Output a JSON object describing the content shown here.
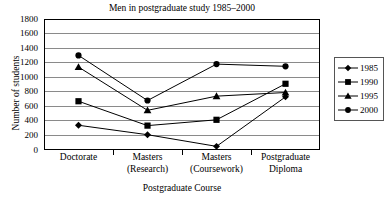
{
  "chart_data": {
    "type": "line",
    "title": "Men in postgraduate study 1985–2000",
    "xlabel": "Postgraduate Course",
    "ylabel": "Number of students",
    "categories": [
      "Doctorate",
      "Masters (Research)",
      "Masters (Coursework)",
      "Postgraduate Diploma"
    ],
    "category_lines": [
      [
        "Doctorate"
      ],
      [
        "Masters",
        "(Research)"
      ],
      [
        "Masters",
        "(Coursework)"
      ],
      [
        "Postgraduate",
        "Diploma"
      ]
    ],
    "ylim": [
      0,
      1800
    ],
    "ytick_step": 200,
    "yticks": [
      1800,
      1600,
      1400,
      1200,
      1000,
      800,
      600,
      400,
      200,
      0
    ],
    "ytick_labels": [
      "1800",
      "1600",
      "1400",
      "1200",
      "1000",
      "800",
      "600",
      "400",
      "200",
      "0"
    ],
    "grid": "horizontal",
    "legend_position": "right",
    "series": [
      {
        "name": "1985",
        "marker": "diamond",
        "color": "#000000",
        "values": [
          340,
          210,
          50,
          730
        ]
      },
      {
        "name": "1990",
        "marker": "square",
        "color": "#000000",
        "values": [
          670,
          335,
          415,
          910
        ]
      },
      {
        "name": "1995",
        "marker": "triangle",
        "color": "#000000",
        "values": [
          1140,
          545,
          740,
          790
        ]
      },
      {
        "name": "2000",
        "marker": "circle",
        "color": "#000000",
        "values": [
          1300,
          680,
          1180,
          1150
        ]
      }
    ]
  },
  "legend": {
    "entries": [
      {
        "label": "1985",
        "marker": "diamond"
      },
      {
        "label": "1990",
        "marker": "square"
      },
      {
        "label": "1995",
        "marker": "triangle"
      },
      {
        "label": "2000",
        "marker": "circle"
      }
    ]
  },
  "colors": {
    "axis": "#000000",
    "grid": "#8a8a8a",
    "series": "#000000",
    "background": "#ffffff"
  }
}
